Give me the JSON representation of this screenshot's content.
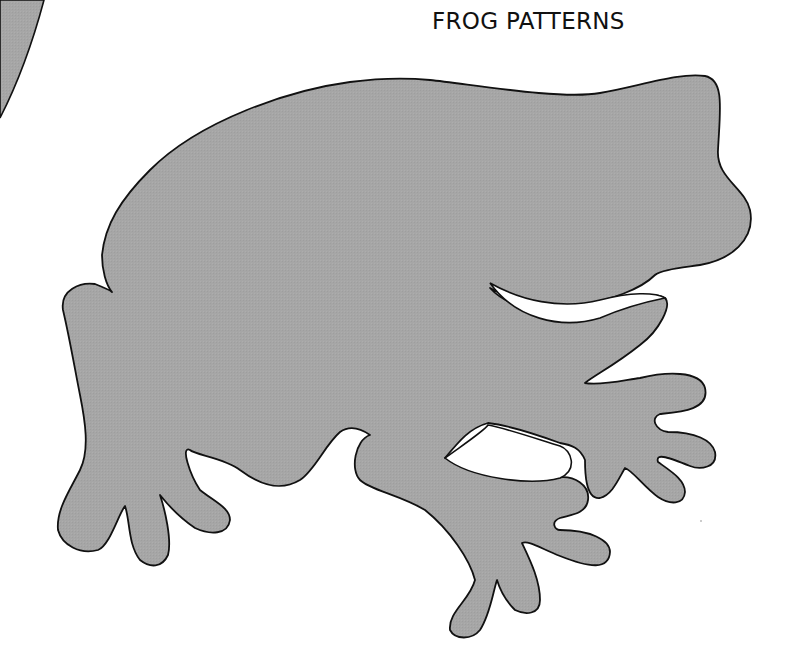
{
  "page": {
    "title": "FROG PATTERNS"
  },
  "artwork": {
    "subject": "frog-silhouette",
    "fill_color": "#a6a6a6",
    "outline_color": "#111111",
    "background": "#ffffff"
  }
}
